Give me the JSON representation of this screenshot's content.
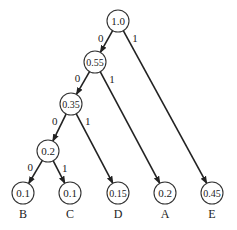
{
  "diagram": {
    "nodes": [
      {
        "id": "n10",
        "value": "1.0",
        "x": 118,
        "y": 21
      },
      {
        "id": "n055",
        "value": "0.55",
        "x": 95,
        "y": 62
      },
      {
        "id": "n035",
        "value": "0.35",
        "x": 71,
        "y": 104
      },
      {
        "id": "n02i",
        "value": "0.2",
        "x": 48,
        "y": 151
      },
      {
        "id": "B",
        "value": "0.1",
        "x": 23,
        "y": 193,
        "symbol": "B"
      },
      {
        "id": "C",
        "value": "0.1",
        "x": 70,
        "y": 193,
        "symbol": "C"
      },
      {
        "id": "D",
        "value": "0.15",
        "x": 118,
        "y": 193,
        "symbol": "D"
      },
      {
        "id": "A",
        "value": "0.2",
        "x": 165,
        "y": 193,
        "symbol": "A"
      },
      {
        "id": "E",
        "value": "0.45",
        "x": 212,
        "y": 193,
        "symbol": "E"
      }
    ],
    "edges": [
      {
        "from": "n10",
        "to": "n055",
        "bit": "0"
      },
      {
        "from": "n10",
        "to": "E",
        "bit": "1"
      },
      {
        "from": "n055",
        "to": "n035",
        "bit": "0"
      },
      {
        "from": "n055",
        "to": "A",
        "bit": "1"
      },
      {
        "from": "n035",
        "to": "n02i",
        "bit": "0"
      },
      {
        "from": "n035",
        "to": "D",
        "bit": "1"
      },
      {
        "from": "n02i",
        "to": "B",
        "bit": "0"
      },
      {
        "from": "n02i",
        "to": "C",
        "bit": "1"
      }
    ]
  }
}
